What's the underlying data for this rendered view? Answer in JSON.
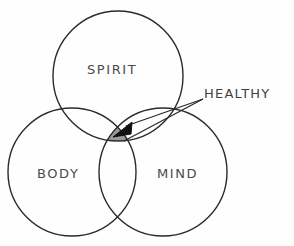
{
  "diagram": {
    "type": "venn",
    "title": "",
    "background_color": "#fefefe",
    "stroke_color": "#2b2b2b",
    "highlight_fill_color": "#9a9a9a",
    "label_color": "#4a4a4a",
    "sets": [
      {
        "id": "spirit",
        "label": "SPIRIT",
        "cx": 118,
        "cy": 76,
        "r": 65
      },
      {
        "id": "body",
        "label": "BODY",
        "cx": 72,
        "cy": 172,
        "r": 64
      },
      {
        "id": "mind",
        "label": "MIND",
        "cx": 163,
        "cy": 172,
        "r": 64
      }
    ],
    "intersection": {
      "id": "healthy",
      "label": "HEALTHY",
      "description": "central triple overlap of SPIRIT, BODY and MIND",
      "shaded": true
    },
    "annotation": {
      "label": "HEALTHY",
      "leader_lines": 2,
      "arrow_target_x": 118,
      "arrow_target_y": 136
    }
  }
}
